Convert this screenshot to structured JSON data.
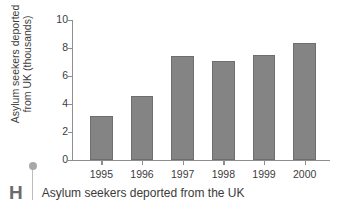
{
  "chart_data": {
    "type": "bar",
    "title": "",
    "xlabel": "",
    "ylabel_lines": [
      "Asylum seekers deported",
      "from UK (thousands)"
    ],
    "ylabel": "Asylum seekers deported from UK (thousands)",
    "categories": [
      "1995",
      "1996",
      "1997",
      "1998",
      "1999",
      "2000"
    ],
    "values": [
      3.15,
      4.6,
      7.45,
      7.05,
      7.5,
      8.35
    ],
    "ylim": [
      0,
      10
    ],
    "yticks": [
      0,
      2,
      4,
      6,
      8,
      10
    ],
    "ytick_labels": [
      "0",
      "2",
      "4",
      "6",
      "8",
      "10"
    ],
    "grid": false,
    "legend": "none",
    "series_color": "#848484",
    "axis_color": "#8e8e8e"
  },
  "footer": {
    "marker_letter": "H",
    "caption": "Asylum seekers deported from the UK"
  }
}
